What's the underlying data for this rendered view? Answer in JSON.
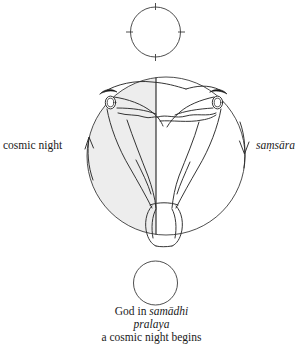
{
  "diagram": {
    "title_caption": {
      "line1_prefix": "God in ",
      "line1_italic": "samādhi",
      "line2_italic": "pralaya",
      "line3": "a cosmic night begins"
    },
    "left_label": "cosmic night",
    "right_label": "saṃsāra",
    "left_arrow_direction": "up",
    "right_arrow_direction": "down",
    "top_circle": {
      "name": "top-circle",
      "has_tick_marks": true,
      "tick_positions": [
        "north",
        "south",
        "east",
        "west"
      ],
      "fill": "#ffffff"
    },
    "bottom_circle": {
      "name": "bottom-circle",
      "has_tick_marks": false,
      "fill": "#ffffff"
    },
    "main_circle": {
      "name": "main-circle",
      "left_half_fill": "#ededed",
      "right_half_fill": "#ffffff",
      "divider": "vertical-center-line",
      "figure": "inverted-human-figure"
    },
    "colors": {
      "ink": "#1a1a1a",
      "stroke": "#3a3a3a",
      "shade": "#ededed",
      "background": "#ffffff"
    }
  }
}
